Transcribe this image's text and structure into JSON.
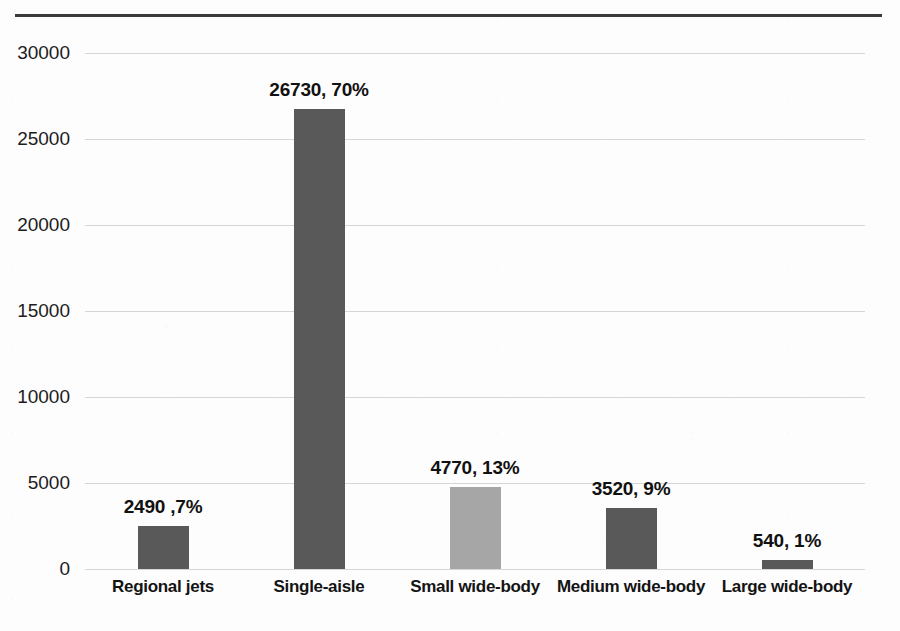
{
  "figure": {
    "background_color": "#fdfdfd",
    "top_rule_color": "#3a3a3a",
    "gridline_color": "#d6d6d6"
  },
  "chart_data": {
    "type": "bar",
    "title": "",
    "subtitle": "",
    "xlabel": "",
    "ylabel": "",
    "categories": [
      "Regional jets",
      "Single-aisle",
      "Small wide-body",
      "Medium wide-body",
      "Large wide-body"
    ],
    "values": [
      2490,
      26730,
      4770,
      3520,
      540
    ],
    "percentages": [
      7,
      70,
      13,
      9,
      1
    ],
    "data_labels": [
      "2490 ,7%",
      "26730, 70%",
      "4770, 13%",
      "3520, 9%",
      "540, 1%"
    ],
    "bar_colors": [
      "#595959",
      "#595959",
      "#a6a6a6",
      "#595959",
      "#595959"
    ],
    "ylim": [
      0,
      30000
    ],
    "yticks": [
      0,
      5000,
      10000,
      15000,
      20000,
      25000,
      30000
    ],
    "ytick_labels": [
      "0",
      "5000",
      "10000",
      "15000",
      "20000",
      "25000",
      "30000"
    ],
    "grid": "horizontal",
    "legend": "none",
    "annotations": []
  }
}
